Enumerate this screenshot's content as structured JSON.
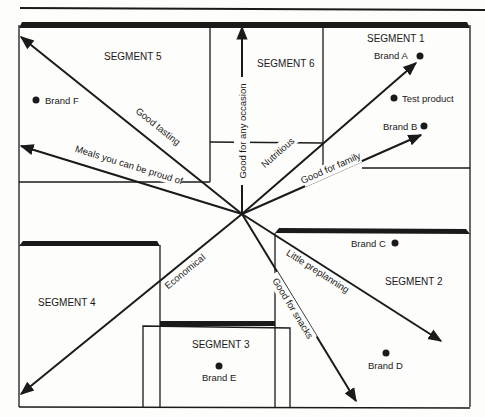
{
  "diagram": {
    "type": "perceptual-map",
    "center": [
      242,
      214
    ],
    "segments": [
      {
        "id": 1,
        "label": "SEGMENT 1"
      },
      {
        "id": 2,
        "label": "SEGMENT 2"
      },
      {
        "id": 3,
        "label": "SEGMENT 3"
      },
      {
        "id": 4,
        "label": "SEGMENT 4"
      },
      {
        "id": 5,
        "label": "SEGMENT 5"
      },
      {
        "id": 6,
        "label": "SEGMENT 6"
      }
    ],
    "brands": [
      {
        "label": "Brand A"
      },
      {
        "label": "Test product"
      },
      {
        "label": "Brand B"
      },
      {
        "label": "Brand C"
      },
      {
        "label": "Brand D"
      },
      {
        "label": "Brand E"
      },
      {
        "label": "Brand F"
      }
    ],
    "vectors": [
      {
        "label": "Good tasting"
      },
      {
        "label": "Meals you can be proud of"
      },
      {
        "label": "Good for any occasion"
      },
      {
        "label": "Nutritious"
      },
      {
        "label": "Good for family"
      },
      {
        "label": "Little preplanning"
      },
      {
        "label": "Good for snacks"
      },
      {
        "label": "Economical"
      }
    ]
  }
}
